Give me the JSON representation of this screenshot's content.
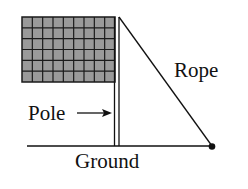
{
  "labels": {
    "rope": "Rope",
    "pole": "Pole",
    "ground": "Ground"
  },
  "flag": {
    "columns": 9,
    "rows": 6,
    "fill": "#9a9a9a",
    "grid_color": "#1a1a1a"
  },
  "colors": {
    "line": "#111111",
    "background": "#ffffff"
  }
}
